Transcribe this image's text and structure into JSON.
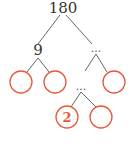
{
  "diagram": {
    "type": "factor-tree",
    "root": "180",
    "level1_left": "9",
    "level1_right": "...",
    "level2_mid": "...",
    "bottom_left_circle": "2",
    "colors": {
      "circle": "#e8593a",
      "line": "#666666",
      "text": "#333333"
    }
  }
}
